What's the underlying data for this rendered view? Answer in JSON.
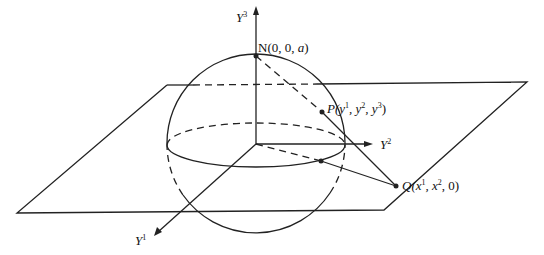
{
  "diagram": {
    "type": "stereographic-projection",
    "colors": {
      "stroke": "#222222",
      "background": "#ffffff"
    },
    "axes": {
      "y3": {
        "base": "Y",
        "sup": "3"
      },
      "y2": {
        "base": "Y",
        "sup": "2"
      },
      "y1": {
        "base": "Y",
        "sup": "1"
      }
    },
    "points": {
      "N": {
        "name": "N",
        "coords": "(0, 0, ",
        "a": "a",
        "close": ")"
      },
      "P": {
        "name": "P",
        "open": "(y",
        "s1": "1",
        "m1": ", y",
        "s2": "2",
        "m2": ", y",
        "s3": "3",
        "close": ")"
      },
      "Q": {
        "name": "Q",
        "open": "(x",
        "s1": "1",
        "m1": ", x",
        "s2": "2",
        "close": ", 0)"
      }
    }
  }
}
